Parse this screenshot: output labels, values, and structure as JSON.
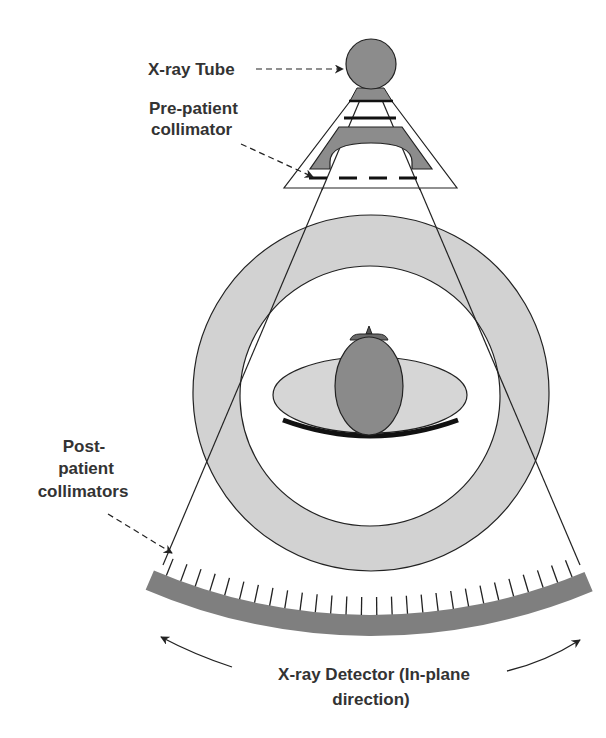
{
  "diagram": {
    "labels": {
      "xray_tube": "X-ray Tube",
      "pre_patient_line1": "Pre-patient",
      "pre_patient_line2": "collimator",
      "post_patient_line1": "Post-",
      "post_patient_line2": "patient",
      "post_patient_line3": "collimators",
      "detector_line1": "X-ray Detector (In-plane",
      "detector_line2": "direction)"
    },
    "components": [
      "x-ray-tube",
      "pre-patient-collimator",
      "gantry-ring",
      "patient-head",
      "patient-table",
      "post-patient-collimators",
      "x-ray-detector"
    ],
    "detector": {
      "tick_count": 28
    },
    "colors": {
      "tube": "#8c8c8c",
      "collimator_block": "#8c8c8c",
      "gantry_ring": "#d2d2d2",
      "table": "#d6d6d6",
      "head": "#8a8a8a",
      "detector": "#7f7f7f",
      "outline": "#222222",
      "text": "#333333"
    }
  }
}
